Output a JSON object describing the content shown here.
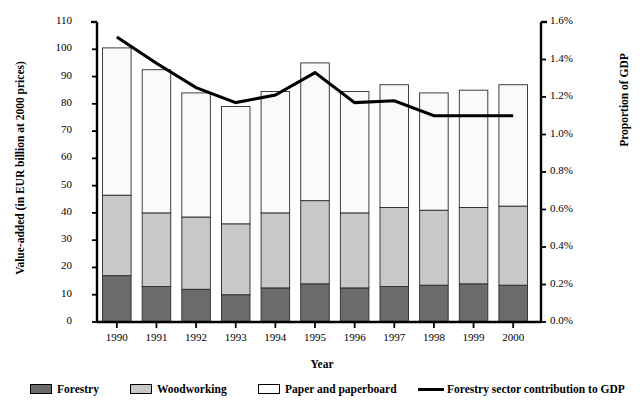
{
  "chart_data": {
    "type": "bar",
    "subtype": "stacked-bar-with-line-overlay",
    "title": "",
    "xlabel": "Year",
    "ylabel": "Value-added (in EUR billion at 2000 prices)",
    "y2label": "Proportion of GDP",
    "categories": [
      "1990",
      "1991",
      "1992",
      "1993",
      "1994",
      "1995",
      "1996",
      "1997",
      "1998",
      "1999",
      "2000"
    ],
    "ylim": [
      0,
      110
    ],
    "yticks": [
      "0",
      "10",
      "20",
      "30",
      "40",
      "50",
      "60",
      "70",
      "80",
      "90",
      "100",
      "110"
    ],
    "y2lim": [
      0.0,
      1.6
    ],
    "y2ticks": [
      "0.0%",
      "0.2%",
      "0.4%",
      "0.6%",
      "0.8%",
      "1.0%",
      "1.2%",
      "1.4%",
      "1.6%"
    ],
    "grid": false,
    "legend_position": "bottom",
    "series": [
      {
        "name": "Forestry",
        "axis": "left",
        "color": "#6b6b6b",
        "values": [
          17.0,
          13.0,
          12.0,
          10.0,
          12.5,
          14.0,
          12.5,
          13.0,
          13.5,
          14.0,
          13.5
        ]
      },
      {
        "name": "Woodworking",
        "axis": "left",
        "color": "#c8c8c8",
        "values": [
          29.5,
          27.0,
          26.5,
          26.0,
          27.5,
          30.5,
          27.5,
          29.0,
          27.5,
          28.0,
          29.0
        ]
      },
      {
        "name": "Paper and paperboard",
        "axis": "left",
        "color": "#fafafa",
        "values": [
          54.0,
          52.5,
          45.5,
          43.0,
          44.5,
          50.5,
          44.5,
          45.0,
          43.0,
          43.0,
          44.5
        ]
      },
      {
        "name": "Forestry sector contribution to GDP",
        "axis": "right",
        "type": "line",
        "color": "#000000",
        "values": [
          1.52,
          1.38,
          1.25,
          1.17,
          1.21,
          1.33,
          1.17,
          1.18,
          1.1,
          1.1,
          1.1
        ]
      }
    ],
    "totals": [
      100.5,
      92.5,
      84.0,
      79.0,
      84.5,
      95.0,
      84.5,
      87.0,
      84.0,
      85.0,
      87.0
    ]
  },
  "legend": {
    "items": [
      {
        "label": "Forestry",
        "marker": "swatch-dark"
      },
      {
        "label": "Woodworking",
        "marker": "swatch-gray"
      },
      {
        "label": "Paper and paperboard",
        "marker": "swatch-white"
      },
      {
        "label": "Forestry sector contribution to GDP",
        "marker": "line-black"
      }
    ]
  },
  "colors": {
    "forestry": "#6b6b6b",
    "woodworking": "#c8c8c8",
    "paper": "#fafafa",
    "line": "#000000",
    "axis": "#000000"
  }
}
